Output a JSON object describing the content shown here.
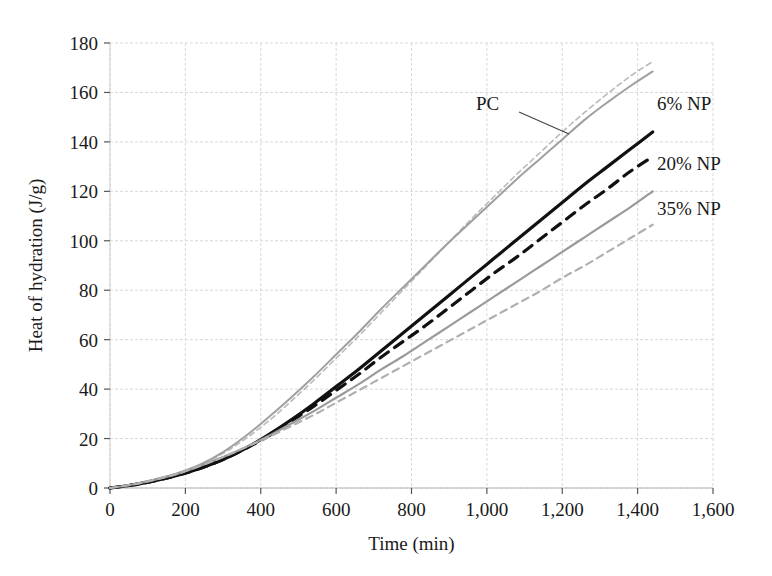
{
  "chart_data": {
    "type": "line",
    "title": "",
    "xlabel": "Time (min)",
    "ylabel": "Heat of hydration (J/g)",
    "xlim": [
      0,
      1600
    ],
    "ylim": [
      0,
      180
    ],
    "xticks": [
      0,
      200,
      400,
      600,
      800,
      1000,
      1200,
      1400,
      1600
    ],
    "xtick_labels": [
      "0",
      "200",
      "400",
      "600",
      "800",
      "1,000",
      "1,200",
      "1,400",
      "1,600"
    ],
    "yticks": [
      0,
      20,
      40,
      60,
      80,
      100,
      120,
      140,
      160,
      180
    ],
    "ytick_labels": [
      "0",
      "20",
      "40",
      "60",
      "80",
      "100",
      "120",
      "140",
      "160",
      "180"
    ],
    "grid": true,
    "grid_color": "#d8d8d8",
    "legend_position": "inline-right-annotations",
    "x": [
      0,
      60,
      120,
      180,
      240,
      300,
      360,
      420,
      480,
      540,
      600,
      660,
      720,
      780,
      840,
      900,
      960,
      1020,
      1080,
      1140,
      1200,
      1260,
      1320,
      1380,
      1440
    ],
    "series": [
      {
        "name": "PC",
        "label": "PC",
        "color": "#b9b9b9",
        "style": "dashed",
        "width": 1.6,
        "values": [
          0,
          1.5,
          3.5,
          6.0,
          9.5,
          14.0,
          20.0,
          27.0,
          35.0,
          43.5,
          52.5,
          61.5,
          71.0,
          80.5,
          90.0,
          99.5,
          109.0,
          118.0,
          127.0,
          135.5,
          144.0,
          152.0,
          159.5,
          166.5,
          172.5
        ]
      },
      {
        "name": "6% NP",
        "label": "6% NP",
        "color": "#a0a0a0",
        "style": "solid",
        "width": 2.0,
        "values": [
          0,
          1.5,
          3.5,
          6.0,
          9.5,
          14.5,
          21.0,
          28.5,
          36.5,
          45.0,
          54.0,
          63.0,
          72.5,
          81.5,
          90.5,
          99.5,
          108.0,
          116.5,
          125.0,
          133.0,
          141.0,
          149.0,
          156.0,
          162.5,
          168.5
        ]
      },
      {
        "name": "20% NP solid",
        "label": "20% NP",
        "color": "#111111",
        "style": "solid",
        "width": 3.2,
        "values": [
          0,
          1.2,
          3.0,
          5.2,
          8.0,
          11.5,
          16.0,
          21.5,
          27.5,
          34.0,
          41.0,
          48.0,
          55.5,
          63.0,
          70.5,
          78.0,
          85.5,
          93.0,
          100.5,
          108.0,
          115.5,
          123.0,
          130.0,
          137.0,
          144.0
        ]
      },
      {
        "name": "20% NP dashed",
        "label": "",
        "color": "#111111",
        "style": "dashed",
        "width": 3.2,
        "values": [
          0,
          1.2,
          3.0,
          5.2,
          8.0,
          11.5,
          16.0,
          21.0,
          27.0,
          33.0,
          39.5,
          46.0,
          53.0,
          59.5,
          66.0,
          73.0,
          80.0,
          87.0,
          93.5,
          100.5,
          107.5,
          114.5,
          121.0,
          128.0,
          134.0
        ]
      },
      {
        "name": "35% NP solid",
        "label": "35% NP",
        "color": "#9a9a9a",
        "style": "solid",
        "width": 2.2,
        "values": [
          0,
          1.4,
          3.4,
          5.8,
          9.0,
          12.5,
          16.5,
          21.0,
          26.0,
          31.0,
          36.5,
          42.0,
          48.0,
          53.5,
          59.5,
          65.5,
          71.5,
          77.5,
          83.5,
          89.5,
          95.5,
          101.5,
          107.5,
          113.5,
          120.0
        ]
      },
      {
        "name": "35% NP dashed",
        "label": "",
        "color": "#b0b0b0",
        "style": "dashed",
        "width": 2.2,
        "values": [
          0,
          1.4,
          3.4,
          5.8,
          9.0,
          12.5,
          16.5,
          20.5,
          25.0,
          29.5,
          34.5,
          39.5,
          44.5,
          49.5,
          54.5,
          59.5,
          64.5,
          69.5,
          74.5,
          79.5,
          85.0,
          90.0,
          95.5,
          101.0,
          106.5
        ]
      }
    ],
    "annotations": [
      {
        "text": "PC",
        "x_px": 476,
        "y_px": 110,
        "leader": {
          "x1": 519,
          "y1": 112,
          "x2": 569,
          "y2": 134
        }
      },
      {
        "text": "6% NP",
        "x_px": 657,
        "y_px": 110,
        "leader": null
      },
      {
        "text": "20% NP",
        "x_px": 657,
        "y_px": 170,
        "leader": null
      },
      {
        "text": "35% NP",
        "x_px": 657,
        "y_px": 215,
        "leader": null
      }
    ]
  }
}
